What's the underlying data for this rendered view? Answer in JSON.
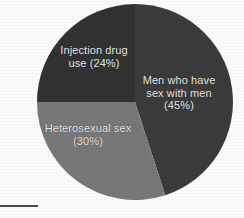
{
  "chart_data": {
    "type": "pie",
    "title": "",
    "subtitle": "",
    "xlabel": "",
    "ylabel": "",
    "legend_position": "none",
    "grid": false,
    "labels_inside_slices": true,
    "start_angle_deg": 0,
    "direction": "clockwise",
    "categories": [
      "Men who have sex with men",
      "Heterosexual sex",
      "Injection drug use"
    ],
    "values": [
      45,
      30,
      24
    ],
    "value_unit": "%",
    "slices": [
      {
        "name": "Men who have sex with men",
        "value": 45,
        "percent_text": "(45%)",
        "label_text": "Men who have\nsex with men\n(45%)",
        "color": "#3b3b3b",
        "start_angle_deg": 0,
        "end_angle_deg": 162
      },
      {
        "name": "Heterosexual sex",
        "value": 30,
        "percent_text": "(30%)",
        "label_text": "Heterosexual sex\n(30%)",
        "color": "#787878",
        "start_angle_deg": 162,
        "end_angle_deg": 270
      },
      {
        "name": "Injection drug use",
        "value": 24,
        "percent_text": "(24%)",
        "label_text": "Injection drug\nuse (24%)",
        "color": "#323232",
        "start_angle_deg": 270,
        "end_angle_deg": 360
      }
    ]
  },
  "figure": {
    "background_color": "#fbfbfa",
    "label_color": "#e9e9e9",
    "rule_color": "#4a4a4a"
  }
}
